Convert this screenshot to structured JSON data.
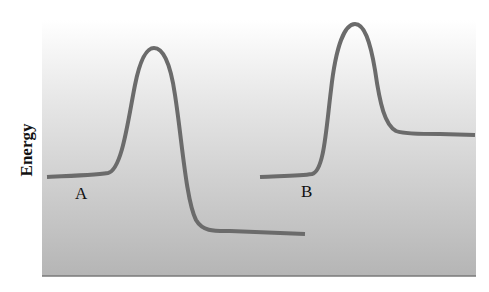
{
  "diagram": {
    "y_axis_label": "Energy",
    "x_axis_label": "",
    "panel": {
      "x": 42,
      "y": 20,
      "width": 434,
      "height": 256,
      "gradient_top": "#ffffff",
      "gradient_bottom": "#b5b5b5",
      "baseline_color": "#7a7a7a"
    },
    "curve_color": "#6b6b6b",
    "curves": [
      {
        "label": "A",
        "description": "Energy profile: reactants at mid level, high activation peak, products at low level (exergonic)",
        "reactant_level": "middle",
        "product_level": "low",
        "path": "M47,177 C70,176 95,175 108,173 C122,170 128,120 135,85 C141,55 148,48 154,48 C162,48 170,60 175,95 C182,140 186,200 196,220 C203,232 215,231 230,231 L305,234"
      },
      {
        "label": "B",
        "description": "Energy profile: reactants at mid level, high activation peak, products at higher level (endergonic)",
        "reactant_level": "middle",
        "product_level": "high",
        "path": "M260,177 C280,176 300,176 312,174 C324,171 326,130 331,90 C336,45 345,24 355,24 C364,24 370,40 375,70 C380,105 385,125 396,131 C404,134 420,134 440,134 L475,135"
      }
    ],
    "labels": [
      {
        "text": "A",
        "x": 75,
        "y": 184
      },
      {
        "text": "B",
        "x": 301,
        "y": 182
      }
    ]
  }
}
